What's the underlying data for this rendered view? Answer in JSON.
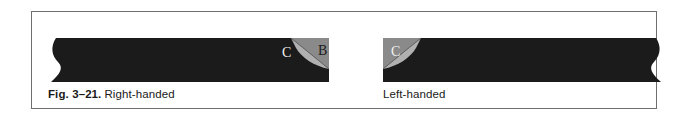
{
  "figure": {
    "number_label": "Fig. 3–21.",
    "panels": [
      {
        "id": "right-handed",
        "caption": "Right-handed",
        "orientation": "fold-on-right",
        "labels": {
          "c": "C",
          "b": "B"
        }
      },
      {
        "id": "left-handed",
        "caption": "Left-handed",
        "orientation": "fold-on-left",
        "labels": {
          "c": "C",
          "b": "B"
        }
      }
    ]
  },
  "colors": {
    "frame_border": "#6e6e70",
    "band_dark": "#1b1b1b",
    "fold_gray": "#8a8a8a",
    "flap_light": "#b5b5b5",
    "page_background": "#ffffff",
    "letter_light": "#f2f2f0",
    "letter_dark": "#1b1b1b"
  }
}
